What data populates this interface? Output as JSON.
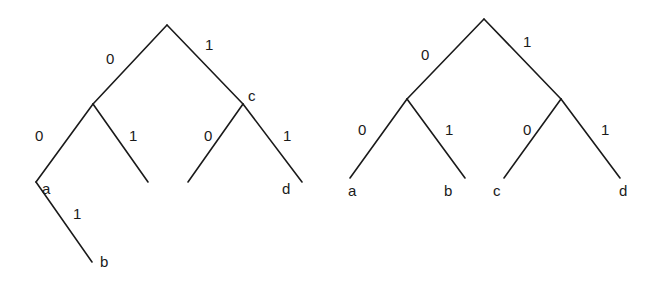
{
  "diagram": {
    "type": "binary-code-trees",
    "colors": {
      "stroke": "#1a1a1a",
      "background": "#ffffff"
    },
    "trees": [
      {
        "name": "left-tree",
        "description": "Non-prefix-free code tree: a is an internal node with child b",
        "nodes": {
          "root": [
            167,
            25
          ],
          "n0": [
            93,
            104
          ],
          "c": [
            243,
            104
          ],
          "a": [
            36,
            182
          ],
          "n01_end": [
            148,
            182
          ],
          "c0_end": [
            188,
            182
          ],
          "d": [
            302,
            182
          ],
          "b": [
            92,
            262
          ]
        },
        "edges": [
          {
            "from": "root",
            "to": "n0",
            "label": "0",
            "label_pos": [
              106,
              64
            ]
          },
          {
            "from": "root",
            "to": "c",
            "label": "1",
            "label_pos": [
              205,
              50
            ]
          },
          {
            "from": "n0",
            "to": "a",
            "label": "0",
            "label_pos": [
              35,
              141
            ]
          },
          {
            "from": "n0",
            "to": "n01_end",
            "label": "1",
            "label_pos": [
              129,
              141
            ]
          },
          {
            "from": "c",
            "to": "c0_end",
            "label": "0",
            "label_pos": [
              204,
              141
            ]
          },
          {
            "from": "c",
            "to": "d",
            "label": "1",
            "label_pos": [
              283,
              141
            ]
          },
          {
            "from": "a",
            "to": "b",
            "label": "1",
            "label_pos": [
              73,
              219
            ]
          }
        ],
        "node_labels": [
          {
            "text": "c",
            "pos": [
              248,
              101
            ]
          },
          {
            "text": "a",
            "pos": [
              42,
              194
            ]
          },
          {
            "text": "d",
            "pos": [
              282,
              194
            ]
          },
          {
            "text": "b",
            "pos": [
              100,
              267
            ]
          }
        ]
      },
      {
        "name": "right-tree",
        "description": "Prefix-free code tree: a, b, c, d all leaves",
        "nodes": {
          "root": [
            484,
            19
          ],
          "n0": [
            407,
            99
          ],
          "n1": [
            561,
            99
          ],
          "a": [
            350,
            178
          ],
          "b": [
            465,
            178
          ],
          "c": [
            504,
            178
          ],
          "d": [
            620,
            178
          ]
        },
        "edges": [
          {
            "from": "root",
            "to": "n0",
            "label": "0",
            "label_pos": [
              421,
              60
            ]
          },
          {
            "from": "root",
            "to": "n1",
            "label": "1",
            "label_pos": [
              523,
              47
            ]
          },
          {
            "from": "n0",
            "to": "a",
            "label": "0",
            "label_pos": [
              358,
              135
            ]
          },
          {
            "from": "n0",
            "to": "b",
            "label": "1",
            "label_pos": [
              445,
              135
            ]
          },
          {
            "from": "n1",
            "to": "c",
            "label": "0",
            "label_pos": [
              523,
              135
            ]
          },
          {
            "from": "n1",
            "to": "d",
            "label": "1",
            "label_pos": [
              601,
              135
            ]
          }
        ],
        "node_labels": [
          {
            "text": "a",
            "pos": [
              348,
              196
            ]
          },
          {
            "text": "b",
            "pos": [
              444,
              196
            ]
          },
          {
            "text": "c",
            "pos": [
              493,
              196
            ]
          },
          {
            "text": "d",
            "pos": [
              619,
              196
            ]
          }
        ]
      }
    ]
  }
}
